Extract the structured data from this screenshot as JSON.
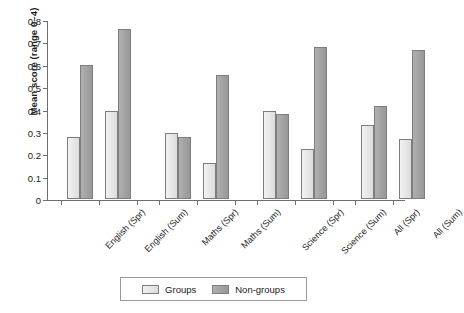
{
  "chart_data": {
    "type": "bar",
    "title": "",
    "xlabel": "",
    "ylabel": "Mean score (range 0–4)",
    "ylim": [
      0,
      0.8
    ],
    "yticks": [
      "0",
      "0.1",
      "0.2",
      "0.3",
      "0.4",
      "0.5",
      "0.6",
      "0.7",
      "0.8"
    ],
    "ytick_values": [
      0,
      0.1,
      0.2,
      0.3,
      0.4,
      0.5,
      0.6,
      0.7,
      0.8
    ],
    "grid": false,
    "legend_position": "bottom",
    "categories": [
      "English (Spr)",
      "English (Sum)",
      "Maths (Spr)",
      "Maths (Sum)",
      "Science (Spr)",
      "Science (Sum)",
      "All (Spr)",
      "All (Sum)"
    ],
    "series": [
      {
        "name": "Groups",
        "color": "#e6e6e6",
        "values": [
          0.275,
          0.395,
          0.295,
          0.16,
          0.395,
          0.225,
          0.33,
          0.27
        ]
      },
      {
        "name": "Non-groups",
        "color": "#a2a2a2",
        "values": [
          0.6,
          0.76,
          0.275,
          0.555,
          0.38,
          0.68,
          0.415,
          0.665
        ]
      }
    ]
  },
  "legend": {
    "items": [
      {
        "label": "Groups",
        "swatch": "groups"
      },
      {
        "label": "Non-groups",
        "swatch": "nongroups"
      }
    ]
  }
}
